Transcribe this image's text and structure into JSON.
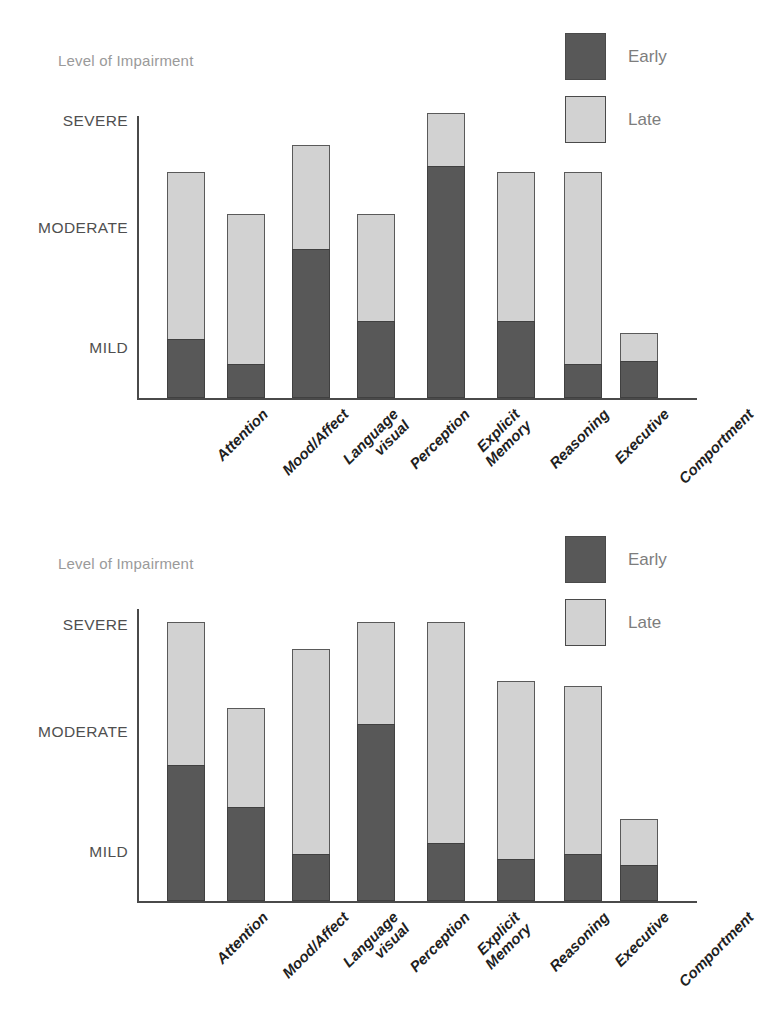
{
  "charts": [
    {
      "caption": "Level of Impairment",
      "legend": [
        {
          "key": "early",
          "label": "Early",
          "color": "#585858"
        },
        {
          "key": "late",
          "label": "Late",
          "color": "#d2d2d2"
        }
      ],
      "y_ticks": [
        {
          "label": "SEVERE",
          "value": 3
        },
        {
          "label": "MODERATE",
          "value": 2
        },
        {
          "label": "MILD",
          "value": 1
        }
      ]
    },
    {
      "caption": "Level of Impairment",
      "legend": [
        {
          "key": "early",
          "label": "Early",
          "color": "#585858"
        },
        {
          "key": "late",
          "label": "Late",
          "color": "#d2d2d2"
        }
      ],
      "y_ticks": [
        {
          "label": "SEVERE",
          "value": 3
        },
        {
          "label": "MODERATE",
          "value": 2
        },
        {
          "label": "MILD",
          "value": 1
        }
      ]
    }
  ],
  "chart_data": [
    {
      "type": "bar",
      "stacked": true,
      "title": "Level of Impairment",
      "xlabel": "",
      "ylabel": "Level of Impairment",
      "ytick_labels": [
        "MILD",
        "MODERATE",
        "SEVERE"
      ],
      "ytick_values": [
        1,
        2,
        3
      ],
      "ylim": [
        0,
        3.2
      ],
      "grid": false,
      "legend_position": "top-right",
      "categories": [
        "Attention",
        "Mood/Affect",
        "Language\nvisual",
        "Perception",
        "Explicit\nMemory",
        "Reasoning",
        "Executive",
        "Comportment"
      ],
      "series": [
        {
          "name": "Early",
          "color": "#585858",
          "values": [
            1.05,
            0.65,
            1.8,
            1.2,
            2.55,
            1.2,
            0.65,
            0.7
          ]
        },
        {
          "name": "Late",
          "color": "#d2d2d2",
          "values": [
            2.5,
            2.1,
            2.75,
            2.1,
            3.05,
            2.5,
            2.5,
            1.1
          ]
        }
      ],
      "series_note": "Late values are cumulative bar tops (total height); Early values are the dark lower segment tops."
    },
    {
      "type": "bar",
      "stacked": true,
      "title": "Level of Impairment",
      "xlabel": "",
      "ylabel": "Level of Impairment",
      "ytick_labels": [
        "MILD",
        "MODERATE",
        "SEVERE"
      ],
      "ytick_values": [
        1,
        2,
        3
      ],
      "ylim": [
        0,
        3.2
      ],
      "grid": false,
      "legend_position": "top-right",
      "categories": [
        "Attention",
        "Mood/Affect",
        "Language\nvisual",
        "Perception",
        "Explicit\nMemory",
        "Reasoning",
        "Executive",
        "Comportment"
      ],
      "series": [
        {
          "name": "Early",
          "color": "#585858",
          "values": [
            1.7,
            1.35,
            0.9,
            2.05,
            1.05,
            0.8,
            0.9,
            0.7
          ]
        },
        {
          "name": "Late",
          "color": "#d2d2d2",
          "values": [
            3.0,
            2.2,
            2.75,
            3.0,
            3.0,
            2.45,
            2.4,
            1.25
          ]
        }
      ],
      "series_note": "Late values are cumulative bar tops (total height); Early values are the dark lower segment tops."
    }
  ]
}
